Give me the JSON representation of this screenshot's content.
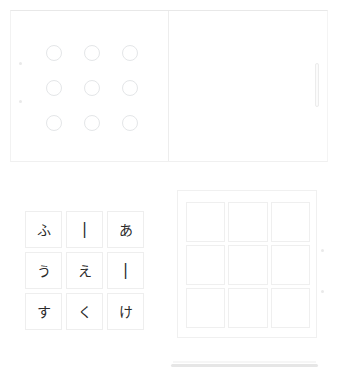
{
  "app": {
    "title": "Hiragana Matching Exercise",
    "background_color": "#ffffff"
  },
  "top_section": {
    "name": "top-panel-pair",
    "left_pane": {
      "label": "circle-target-grid",
      "rows": 3,
      "columns": 3,
      "circles": [
        {
          "id": "circle-1",
          "filled": false
        },
        {
          "id": "circle-2",
          "filled": false
        },
        {
          "id": "circle-3",
          "filled": false
        },
        {
          "id": "circle-4",
          "filled": false
        },
        {
          "id": "circle-5",
          "filled": false
        },
        {
          "id": "circle-6",
          "filled": false
        },
        {
          "id": "circle-7",
          "filled": false
        },
        {
          "id": "circle-8",
          "filled": false
        },
        {
          "id": "circle-9",
          "filled": false
        }
      ],
      "edge_handles": [
        "handle-upper",
        "handle-lower"
      ],
      "border_color": "#e4e6e8"
    },
    "right_pane": {
      "label": "empty-content-pane",
      "content": "",
      "scrollbar": {
        "name": "vertical-scrollbar",
        "orientation": "vertical",
        "thumb_color": "#ececec"
      }
    },
    "divider_color": "#ededed"
  },
  "bottom_section": {
    "name": "bottom-panel-pair",
    "tile_grid": {
      "label": "hiragana-source-tiles",
      "rows": 3,
      "columns": 3,
      "tiles": [
        {
          "id": "tile-r1c1",
          "char": "ふ",
          "kind": "hiragana"
        },
        {
          "id": "tile-r1c2",
          "char": "|",
          "kind": "stroke"
        },
        {
          "id": "tile-r1c3",
          "char": "あ",
          "kind": "hiragana"
        },
        {
          "id": "tile-r2c1",
          "char": "う",
          "kind": "hiragana"
        },
        {
          "id": "tile-r2c2",
          "char": "え",
          "kind": "hiragana"
        },
        {
          "id": "tile-r2c3",
          "char": "|",
          "kind": "stroke"
        },
        {
          "id": "tile-r3c1",
          "char": "す",
          "kind": "hiragana"
        },
        {
          "id": "tile-r3c2",
          "char": "く",
          "kind": "hiragana"
        },
        {
          "id": "tile-r3c3",
          "char": "け",
          "kind": "hiragana"
        }
      ],
      "tile_border_color": "#eeeeee",
      "text_color": "#2a2a2a"
    },
    "drop_grid": {
      "label": "empty-drop-target-grid",
      "rows": 3,
      "columns": 3,
      "cells": [
        {
          "id": "drop-r1c1",
          "char": ""
        },
        {
          "id": "drop-r1c2",
          "char": ""
        },
        {
          "id": "drop-r1c3",
          "char": ""
        },
        {
          "id": "drop-r2c1",
          "char": ""
        },
        {
          "id": "drop-r2c2",
          "char": ""
        },
        {
          "id": "drop-r2c3",
          "char": ""
        },
        {
          "id": "drop-r3c1",
          "char": ""
        },
        {
          "id": "drop-r3c2",
          "char": ""
        },
        {
          "id": "drop-r3c3",
          "char": ""
        }
      ],
      "edge_handles": [
        "handle-upper",
        "handle-lower"
      ],
      "cell_border_color": "#efefef"
    },
    "scrollbar": {
      "name": "horizontal-scrollbar",
      "orientation": "horizontal",
      "track_color": "#e6e6e6"
    }
  }
}
